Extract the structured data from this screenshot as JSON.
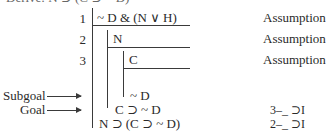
{
  "header_partial": "Derive: N ⊃ (C ⊃ ~ D)",
  "proof": {
    "lines": [
      {
        "num": "1",
        "formula": "~ D & (N ∨ H)",
        "justification": "Assumption"
      },
      {
        "num": "2",
        "formula": "N",
        "justification": "Assumption"
      },
      {
        "num": "3",
        "formula": "C",
        "justification": "Assumption"
      },
      {
        "num": "",
        "formula": "~ D",
        "justification": ""
      },
      {
        "num": "",
        "formula": "C ⊃ ~ D",
        "justification": "3–_ ⊃I"
      },
      {
        "num": "",
        "formula": "N ⊃ (C ⊃ ~ D)",
        "justification": "2–_ ⊃I"
      }
    ]
  },
  "labels": {
    "subgoal": "Subgoal",
    "goal": "Goal"
  },
  "colors": {
    "ink": "#3a3a3a",
    "background": "#ffffff"
  }
}
